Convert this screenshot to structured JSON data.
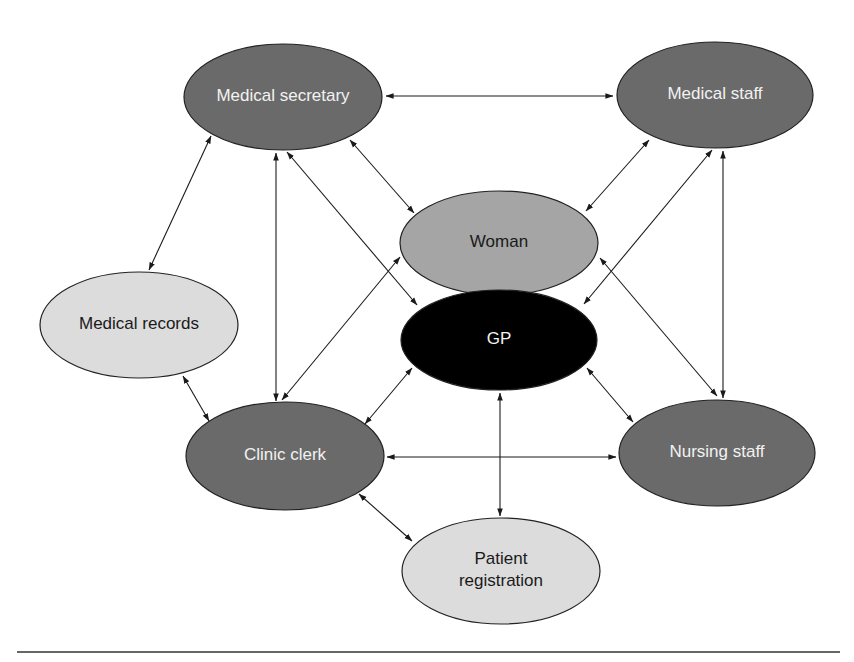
{
  "diagram": {
    "type": "network",
    "colors": {
      "dark_node": "#6a6a6a",
      "mid_node": "#a5a5a5",
      "light_node": "#dcdcdc",
      "gp_node": "#000000",
      "light_text": "#f2f2f2",
      "dark_text": "#1a1a1a",
      "edge": "#1a1a1a"
    },
    "nodes": [
      {
        "id": "medical_secretary",
        "label": "Medical secretary",
        "lines": [
          "Medical secretary"
        ],
        "cx": 283,
        "cy": 97,
        "rx": 99,
        "ry": 53,
        "fill": "#6a6a6a",
        "text": "#f2f2f2"
      },
      {
        "id": "medical_staff",
        "label": "Medical staff",
        "lines": [
          "Medical staff"
        ],
        "cx": 715,
        "cy": 95,
        "rx": 98,
        "ry": 53,
        "fill": "#6a6a6a",
        "text": "#f2f2f2"
      },
      {
        "id": "woman",
        "label": "Woman",
        "lines": [
          "Woman"
        ],
        "cx": 499,
        "cy": 243,
        "rx": 99,
        "ry": 52,
        "fill": "#a5a5a5",
        "text": "#1a1a1a"
      },
      {
        "id": "gp",
        "label": "GP",
        "lines": [
          "GP"
        ],
        "cx": 499,
        "cy": 340,
        "rx": 98,
        "ry": 50,
        "fill": "#000000",
        "text": "#f2f2f2"
      },
      {
        "id": "medical_records",
        "label": "Medical records",
        "lines": [
          "Medical records"
        ],
        "cx": 139,
        "cy": 325,
        "rx": 99,
        "ry": 53,
        "fill": "#dcdcdc",
        "text": "#1a1a1a"
      },
      {
        "id": "clinic_clerk",
        "label": "Clinic clerk",
        "lines": [
          "Clinic clerk"
        ],
        "cx": 285,
        "cy": 456,
        "rx": 99,
        "ry": 54,
        "fill": "#6a6a6a",
        "text": "#f2f2f2"
      },
      {
        "id": "nursing_staff",
        "label": "Nursing staff",
        "lines": [
          "Nursing staff"
        ],
        "cx": 717,
        "cy": 453,
        "rx": 98,
        "ry": 53,
        "fill": "#6a6a6a",
        "text": "#f2f2f2"
      },
      {
        "id": "patient_registration",
        "label": "Patient registration",
        "lines": [
          "Patient",
          "registration"
        ],
        "cx": 501,
        "cy": 571,
        "rx": 99,
        "ry": 53,
        "fill": "#dcdcdc",
        "text": "#1a1a1a"
      }
    ],
    "edges": [
      {
        "from": "medical_secretary",
        "to": "medical_staff",
        "x1": 386,
        "y1": 96,
        "x2": 613,
        "y2": 96,
        "bidirectional": true
      },
      {
        "from": "medical_secretary",
        "to": "medical_records",
        "x1": 211,
        "y1": 136,
        "x2": 149,
        "y2": 270,
        "bidirectional": true
      },
      {
        "from": "medical_secretary",
        "to": "clinic_clerk",
        "x1": 276,
        "y1": 153,
        "x2": 276,
        "y2": 401,
        "bidirectional": true
      },
      {
        "from": "medical_secretary",
        "to": "gp",
        "x1": 287,
        "y1": 152,
        "x2": 417,
        "y2": 305,
        "bidirectional": true
      },
      {
        "from": "medical_secretary",
        "to": "woman",
        "x1": 350,
        "y1": 140,
        "x2": 414,
        "y2": 213,
        "bidirectional": true
      },
      {
        "from": "medical_staff",
        "to": "woman",
        "x1": 649,
        "y1": 140,
        "x2": 586,
        "y2": 211,
        "bidirectional": true
      },
      {
        "from": "medical_staff",
        "to": "gp",
        "x1": 712,
        "y1": 150,
        "x2": 584,
        "y2": 304,
        "bidirectional": true
      },
      {
        "from": "medical_staff",
        "to": "nursing_staff",
        "x1": 723,
        "y1": 151,
        "x2": 723,
        "y2": 398,
        "bidirectional": true
      },
      {
        "from": "woman",
        "to": "nursing_staff",
        "x1": 600,
        "y1": 258,
        "x2": 717,
        "y2": 396,
        "bidirectional": true
      },
      {
        "from": "woman",
        "to": "clinic_clerk",
        "x1": 400,
        "y1": 257,
        "x2": 282,
        "y2": 400,
        "bidirectional": true
      },
      {
        "from": "medical_records",
        "to": "clinic_clerk",
        "x1": 183,
        "y1": 376,
        "x2": 209,
        "y2": 421,
        "bidirectional": true
      },
      {
        "from": "gp",
        "to": "clinic_clerk",
        "x1": 412,
        "y1": 368,
        "x2": 365,
        "y2": 424,
        "bidirectional": true
      },
      {
        "from": "gp",
        "to": "nursing_staff",
        "x1": 587,
        "y1": 368,
        "x2": 633,
        "y2": 422,
        "bidirectional": true
      },
      {
        "from": "gp",
        "to": "patient_registration",
        "x1": 500,
        "y1": 393,
        "x2": 500,
        "y2": 516,
        "bidirectional": true
      },
      {
        "from": "clinic_clerk",
        "to": "nursing_staff",
        "x1": 387,
        "y1": 457,
        "x2": 616,
        "y2": 457,
        "bidirectional": true
      },
      {
        "from": "clinic_clerk",
        "to": "patient_registration",
        "x1": 359,
        "y1": 494,
        "x2": 412,
        "y2": 541,
        "bidirectional": true
      }
    ],
    "rule": {
      "x1": 17,
      "y1": 652,
      "x2": 840,
      "y2": 652
    }
  }
}
